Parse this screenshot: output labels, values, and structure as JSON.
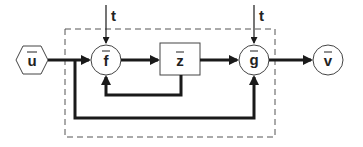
{
  "diagram": {
    "type": "block-diagram",
    "nodes": {
      "input": {
        "label": "u",
        "vector": true,
        "shape": "hexagon"
      },
      "f": {
        "label": "f",
        "vector": true,
        "shape": "circle"
      },
      "z": {
        "label": "z",
        "vector": true,
        "shape": "rectangle"
      },
      "g": {
        "label": "g",
        "vector": true,
        "shape": "circle"
      },
      "output": {
        "label": "v",
        "vector": true,
        "shape": "circle"
      }
    },
    "time_inputs": {
      "f_time": "t",
      "g_time": "t"
    },
    "edges": [
      {
        "from": "u",
        "to": "f"
      },
      {
        "from": "f",
        "to": "z"
      },
      {
        "from": "z",
        "to": "g"
      },
      {
        "from": "g",
        "to": "v"
      },
      {
        "from": "z",
        "to": "f",
        "kind": "feedback"
      },
      {
        "from": "u",
        "to": "g",
        "kind": "bypass"
      },
      {
        "from": "t",
        "to": "f"
      },
      {
        "from": "t",
        "to": "g"
      }
    ],
    "boundary": "dashed"
  },
  "colors": {
    "stroke": "#1a1a1a",
    "dashed": "#555555",
    "background": "#ffffff"
  }
}
